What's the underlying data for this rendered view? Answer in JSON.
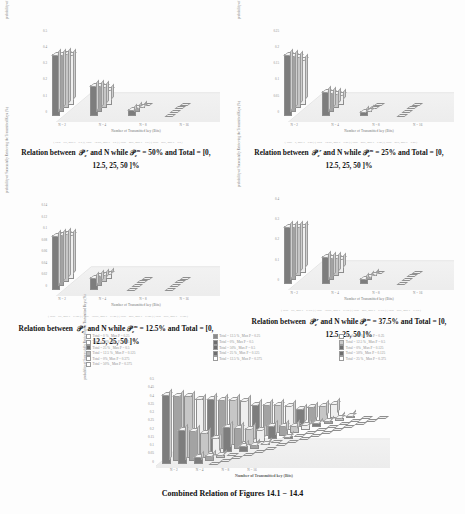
{
  "document": {
    "type": "scanned-academic-page",
    "background_color": "#fdfdfd",
    "text_color": "#2b2b2b"
  },
  "axes_common": {
    "ylabel": "probability of Successfully Retrieving the Transmitted Keys (%)",
    "xlabel": "Number of Transmitted key (Bits)",
    "xticks": [
      "N = 2",
      "N = 4",
      "N = 8",
      "N = 16"
    ]
  },
  "figures": [
    {
      "id": "fig-14-1",
      "caption_prefix": "Relation between",
      "caption_sym1": "P",
      "caption_sup1": "r",
      "caption_sub1": "e",
      "caption_mid": "and N while",
      "caption_sym2": "P",
      "caption_sup2": "m",
      "caption_sub2": "e",
      "caption_value": "= 50%  and Total  = [0, 12.5, 25, 50 ]%",
      "microlegend": "( Total = 0%, Max P = 0.5 )  ( Total = 12.5%, Max P = 0.5 )  ( Total = 25%, Max P = 0.5 )  ( Total = 50%, Max P = 0.5 )",
      "yticks": [
        "0.5",
        "0.4",
        "0.3",
        "0.2",
        "0.1",
        "0"
      ],
      "chart_data": {
        "type": "bar",
        "title": "Relation between Pe^r and N while Pe^m = 50%",
        "xlabel": "Number of Transmitted key (Bits)",
        "ylabel": "probability of Successfully Retrieving the Transmitted Keys (%)",
        "categories": [
          "N = 2",
          "N = 4",
          "N = 8",
          "N = 16"
        ],
        "ylim": [
          0,
          0.5
        ],
        "grid": true,
        "legend_position": "below",
        "series": [
          {
            "name": "Total = 0 %, Max P = 0.5",
            "values": [
              0.5,
              0.25,
              0.06,
              0.0
            ]
          },
          {
            "name": "Total = 12.5 %, Max P = 0.5",
            "values": [
              0.47,
              0.22,
              0.04,
              0.0
            ]
          },
          {
            "name": "Total = 25 %, Max P = 0.5",
            "values": [
              0.44,
              0.18,
              0.02,
              0.0
            ]
          },
          {
            "name": "Total = 50 %, Max P = 0.5",
            "values": [
              0.4,
              0.12,
              0.0,
              0.0
            ]
          }
        ]
      }
    },
    {
      "id": "fig-14-2",
      "caption_prefix": "Relation between",
      "caption_sym1": "P",
      "caption_sup1": "r",
      "caption_sub1": "e",
      "caption_mid": "and N while",
      "caption_sym2": "P",
      "caption_sup2": "m",
      "caption_sub2": "e",
      "caption_value": "= 25%  and Total  = [0, 12.5, 25, 50 ]%",
      "microlegend": "( Total = 0, Max P = 0.25 ) ( Total = 12.5%, Max P = 0.25 ) ( Total = 25%, Max P = 0.25 ) ( Total = 50%, Max P = 0.25 )",
      "yticks": [
        "0.25",
        "0.2",
        "0.15",
        "0.1",
        "0.05",
        "0"
      ],
      "chart_data": {
        "type": "bar",
        "title": "Relation between Pe^r and N while Pe^m = 25%",
        "xlabel": "Number of Transmitted key (Bits)",
        "ylabel": "probability of Successfully Retrieving the Transmitted Keys (%)",
        "categories": [
          "N = 2",
          "N = 4",
          "N = 8",
          "N = 16"
        ],
        "ylim": [
          0,
          0.25
        ],
        "grid": true,
        "legend_position": "below",
        "series": [
          {
            "name": "Total = 0 %, Max P = 0.25",
            "values": [
              0.25,
              0.1,
              0.02,
              0.0
            ]
          },
          {
            "name": "Total = 12.5 %, Max P = 0.25",
            "values": [
              0.23,
              0.08,
              0.01,
              0.0
            ]
          },
          {
            "name": "Total = 25 %, Max P = 0.25",
            "values": [
              0.21,
              0.06,
              0.0,
              0.0
            ]
          },
          {
            "name": "Total = 50 %, Max P = 0.25",
            "values": [
              0.18,
              0.04,
              0.0,
              0.0
            ]
          }
        ]
      }
    },
    {
      "id": "fig-14-3",
      "caption_prefix": "Relation between",
      "caption_sym1": "P",
      "caption_sup1": "r",
      "caption_sub1": "e",
      "caption_mid": "and N while",
      "caption_sym2": "P",
      "caption_sup2": "m",
      "caption_sub2": "e",
      "caption_value": "= 12.5%  and Total  = [0, 12.5, 25, 50 ]%",
      "microlegend": "( Total = 0%, Max P = 0.125 ) ( Total = 12.5%, Max P = 0.125 ) ( Total = 25%, Max P = 0.125 ) ( Total = 50%, Max P = 0.125 )",
      "yticks": [
        "0.14",
        "0.12",
        "0.1",
        "0.08",
        "0.06",
        "0.04",
        "0.02",
        "0"
      ],
      "chart_data": {
        "type": "bar",
        "title": "Relation between Pe^r and N while Pe^m = 12.5%",
        "xlabel": "Number of Transmitted key (Bits)",
        "ylabel": "probability of Successfully Retrieving the Transmitted Keys (%)",
        "categories": [
          "N = 2",
          "N = 4",
          "N = 8",
          "N = 16"
        ],
        "ylim": [
          0,
          0.14
        ],
        "grid": true,
        "legend_position": "below",
        "series": [
          {
            "name": "Total = 0 %, Max P = 0.125",
            "values": [
              0.125,
              0.03,
              0.002,
              0.0
            ]
          },
          {
            "name": "Total = 12.5 %, Max P = 0.125",
            "values": [
              0.118,
              0.024,
              0.001,
              0.0
            ]
          },
          {
            "name": "Total = 25 %, Max P = 0.125",
            "values": [
              0.11,
              0.018,
              0.0,
              0.0
            ]
          },
          {
            "name": "Total = 50 %, Max P = 0.125",
            "values": [
              0.1,
              0.012,
              0.0,
              0.0
            ]
          }
        ]
      }
    },
    {
      "id": "fig-14-4",
      "caption_prefix": "Relation between",
      "caption_sym1": "P",
      "caption_sup1": "r",
      "caption_sub1": "e",
      "caption_mid": "and N while",
      "caption_sym2": "P",
      "caption_sup2": "m",
      "caption_sub2": "e",
      "caption_value": "= 37.5%  and Total  = [0, 12.5, 25, 50 ]%",
      "microlegend": "( Total = 0%, Max P = 0.375 ) ( Total = 12.5%, Max P = 0.375 ) ( Total = 25%, Max P = 0.375 ) ( Total = 50%, Max P = 0.375 )",
      "yticks": [
        "0.4",
        "0.3",
        "0.2",
        "0.1",
        "0"
      ],
      "chart_data": {
        "type": "bar",
        "title": "Relation between Pe^r and N while Pe^m = 37.5%",
        "xlabel": "Number of Transmitted key (Bits)",
        "ylabel": "probability of Successfully Retrieving the Transmitted Keys (%)",
        "categories": [
          "N = 2",
          "N = 4",
          "N = 8",
          "N = 16"
        ],
        "ylim": [
          0,
          0.4
        ],
        "grid": true,
        "legend_position": "below",
        "series": [
          {
            "name": "Total = 0 %, Max P = 0.375",
            "values": [
              0.375,
              0.18,
              0.04,
              0.0
            ]
          },
          {
            "name": "Total = 12.5 %, Max P = 0.375",
            "values": [
              0.35,
              0.15,
              0.025,
              0.0
            ]
          },
          {
            "name": "Total = 25 %, Max P = 0.375",
            "values": [
              0.325,
              0.12,
              0.012,
              0.0
            ]
          },
          {
            "name": "Total = 50 %, Max P = 0.375",
            "values": [
              0.3,
              0.09,
              0.0,
              0.0
            ]
          }
        ]
      }
    }
  ],
  "shared_legend": {
    "columns": [
      {
        "items": [
          {
            "label": "Total = 0 % , Max P = 0.25",
            "swatch": "#ffffff"
          },
          {
            "label": "Total = 50%, Max P = 0.25",
            "swatch": "#ffffff"
          },
          {
            "label": "Total = 25 % , Max P = 0.5",
            "swatch": "#6e6e6e"
          },
          {
            "label": "Total = 12.5 % , Max P = 0.125",
            "swatch": "#b9b9b9"
          },
          {
            "label": "Total = 0%, Max P = 0.375",
            "swatch": "#ffffff"
          },
          {
            "label": "Total = 50% , Max P = 0.375",
            "swatch": "#ffffff"
          }
        ]
      },
      {
        "items": [
          {
            "label": "Total = 12.5 % , Max P = 0.25",
            "swatch": "#8a8a8a"
          },
          {
            "label": "Total = 0% , Max P = 0.5",
            "swatch": "#6e6e6e"
          },
          {
            "label": "Total = 50% , Max P = 0.5",
            "swatch": "#6e6e6e"
          },
          {
            "label": "Total = 25 % , Max P = 0.125",
            "swatch": "#6e6e6e"
          },
          {
            "label": "Total = 12.5 % , Max P = 0.375",
            "swatch": "#ffffff"
          }
        ]
      },
      {
        "items": [
          {
            "label": "Total = 25 % , Max P = 0.25",
            "swatch": "#ffffff"
          },
          {
            "label": "Total = 12.5 % , Max P = 0.5",
            "swatch": "#c9c9c9"
          },
          {
            "label": "Total = 0% , Max P = 0.125",
            "swatch": "#6e6e6e"
          },
          {
            "label": "Total = 50% , Max P = 0.125",
            "swatch": "#6e6e6e"
          },
          {
            "label": "Total = 25 % , Max P = 0.375",
            "swatch": "#ffffff"
          }
        ]
      }
    ]
  },
  "combined": {
    "caption": "Combined Relation of Figures  14.1 −  14.4",
    "ylabel": "probability of Successfully Retrieving the Transmitted Keys (%)",
    "xlabel": "Number of Transmitted key (Bits)",
    "yticks": [
      "0.5",
      "0.45",
      "0.4",
      "0.35",
      "0.3",
      "0.25",
      "0.2",
      "0.15",
      "0.1",
      "0.05",
      "0"
    ],
    "xticks": [
      "N = 2",
      "N = 4",
      "N = 8",
      "N = 16"
    ],
    "chart_data": {
      "type": "bar",
      "title": "Combined Relation of Figures 14.1 - 14.4",
      "xlabel": "Number of Transmitted key (Bits)",
      "ylabel": "probability of Successfully Retrieving the Transmitted Keys (%)",
      "categories": [
        "N = 2",
        "N = 4",
        "N = 8",
        "N = 16"
      ],
      "ylim": [
        0,
        0.5
      ],
      "grid": true,
      "legend_position": "above",
      "series": [
        {
          "name": "Total = 0 %, Max P = 0.5",
          "values": [
            0.5,
            0.25,
            0.06,
            0.0
          ]
        },
        {
          "name": "Total = 12.5 %, Max P = 0.5",
          "values": [
            0.47,
            0.22,
            0.04,
            0.0
          ]
        },
        {
          "name": "Total = 25 %, Max P = 0.5",
          "values": [
            0.44,
            0.18,
            0.02,
            0.0
          ]
        },
        {
          "name": "Total = 50 %, Max P = 0.5",
          "values": [
            0.4,
            0.12,
            0.0,
            0.0
          ]
        },
        {
          "name": "Total = 0 %, Max P = 0.375",
          "values": [
            0.375,
            0.18,
            0.04,
            0.0
          ]
        },
        {
          "name": "Total = 12.5 %, Max P = 0.375",
          "values": [
            0.35,
            0.15,
            0.025,
            0.0
          ]
        },
        {
          "name": "Total = 25 %, Max P = 0.375",
          "values": [
            0.325,
            0.12,
            0.012,
            0.0
          ]
        },
        {
          "name": "Total = 50 %, Max P = 0.375",
          "values": [
            0.3,
            0.09,
            0.0,
            0.0
          ]
        },
        {
          "name": "Total = 0 %, Max P = 0.25",
          "values": [
            0.25,
            0.1,
            0.02,
            0.0
          ]
        },
        {
          "name": "Total = 12.5 %, Max P = 0.25",
          "values": [
            0.23,
            0.08,
            0.01,
            0.0
          ]
        },
        {
          "name": "Total = 25 %, Max P = 0.25",
          "values": [
            0.21,
            0.06,
            0.0,
            0.0
          ]
        },
        {
          "name": "Total = 50 %, Max P = 0.25",
          "values": [
            0.18,
            0.04,
            0.0,
            0.0
          ]
        },
        {
          "name": "Total = 0 %, Max P = 0.125",
          "values": [
            0.125,
            0.03,
            0.002,
            0.0
          ]
        },
        {
          "name": "Total = 12.5 %, Max P = 0.125",
          "values": [
            0.118,
            0.024,
            0.001,
            0.0
          ]
        },
        {
          "name": "Total = 25 %, Max P = 0.125",
          "values": [
            0.11,
            0.018,
            0.0,
            0.0
          ]
        },
        {
          "name": "Total = 50 %, Max P = 0.125",
          "values": [
            0.1,
            0.012,
            0.0,
            0.0
          ]
        }
      ]
    }
  }
}
